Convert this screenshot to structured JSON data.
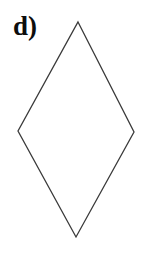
{
  "figure": {
    "label": "d)",
    "label_color": "#0d0d0d",
    "background_color": "#ffffff",
    "canvas": {
      "width": 141,
      "height": 253
    }
  },
  "shape": {
    "name": "rhombus",
    "kind": "quadrilateral",
    "fill": "none",
    "stroke_color": "#3a3a3a",
    "stroke_width": 1.3,
    "vertices": [
      {
        "name": "top",
        "x": 78,
        "y": 22
      },
      {
        "name": "right",
        "x": 134,
        "y": 132
      },
      {
        "name": "bottom",
        "x": 76,
        "y": 237
      },
      {
        "name": "left",
        "x": 18,
        "y": 131
      }
    ],
    "points_attr": "78,22 134,132 76,237 18,131"
  }
}
